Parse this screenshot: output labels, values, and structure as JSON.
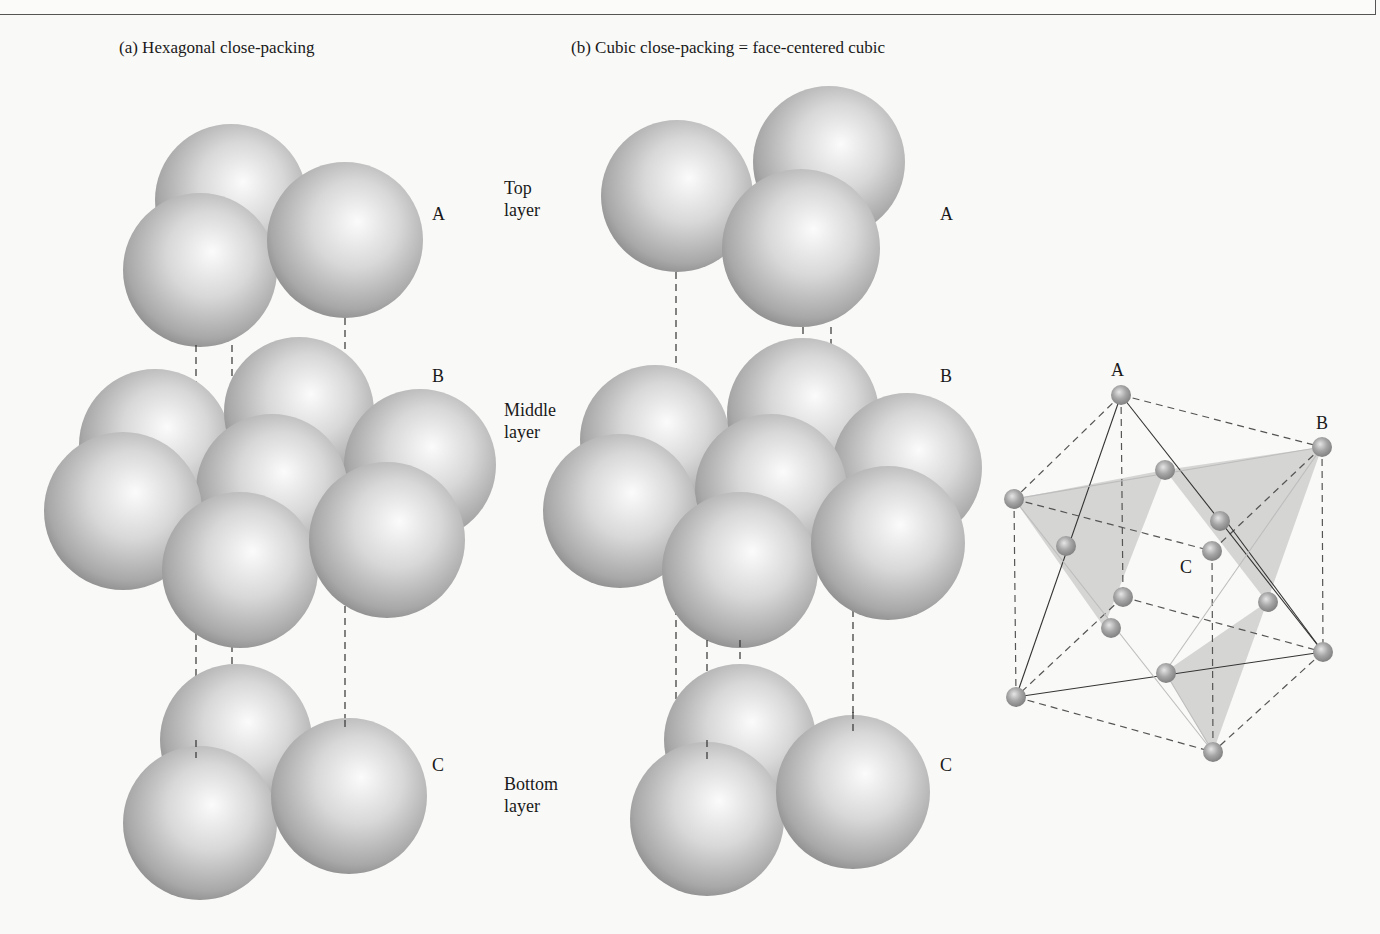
{
  "figure": {
    "panel_a": {
      "title": "(a) Hexagonal close-packing"
    },
    "panel_b": {
      "title": "(b) Cubic close-packing = face-centered cubic"
    },
    "layer_descriptions": {
      "top": "Top\nlayer",
      "middle": "Middle\nlayer",
      "bottom": "Bottom\nlayer"
    },
    "layer_letters": {
      "hcp": [
        "A",
        "B",
        "C"
      ],
      "ccp": [
        "A",
        "B",
        "C"
      ]
    },
    "unit_cell": {
      "labels": [
        "A",
        "B",
        "C"
      ],
      "description": "Face-centered cubic unit cell with close-packed planes highlighted"
    },
    "layers": {
      "hcp": {
        "top": 3,
        "middle": 7,
        "bottom": 3
      },
      "ccp": {
        "top": 3,
        "middle": 7,
        "bottom": 3
      }
    }
  },
  "colors": {
    "sphere_highlight": "#fbfbfb",
    "sphere_mid": "#c9c9c9",
    "sphere_shadow": "#8a8a8a",
    "atom_highlight": "#e6e6e6",
    "atom_shadow": "#7a7a7a",
    "plane_fill": "#c8c8c8",
    "line": "#333333",
    "background": "#f9f9f7"
  }
}
